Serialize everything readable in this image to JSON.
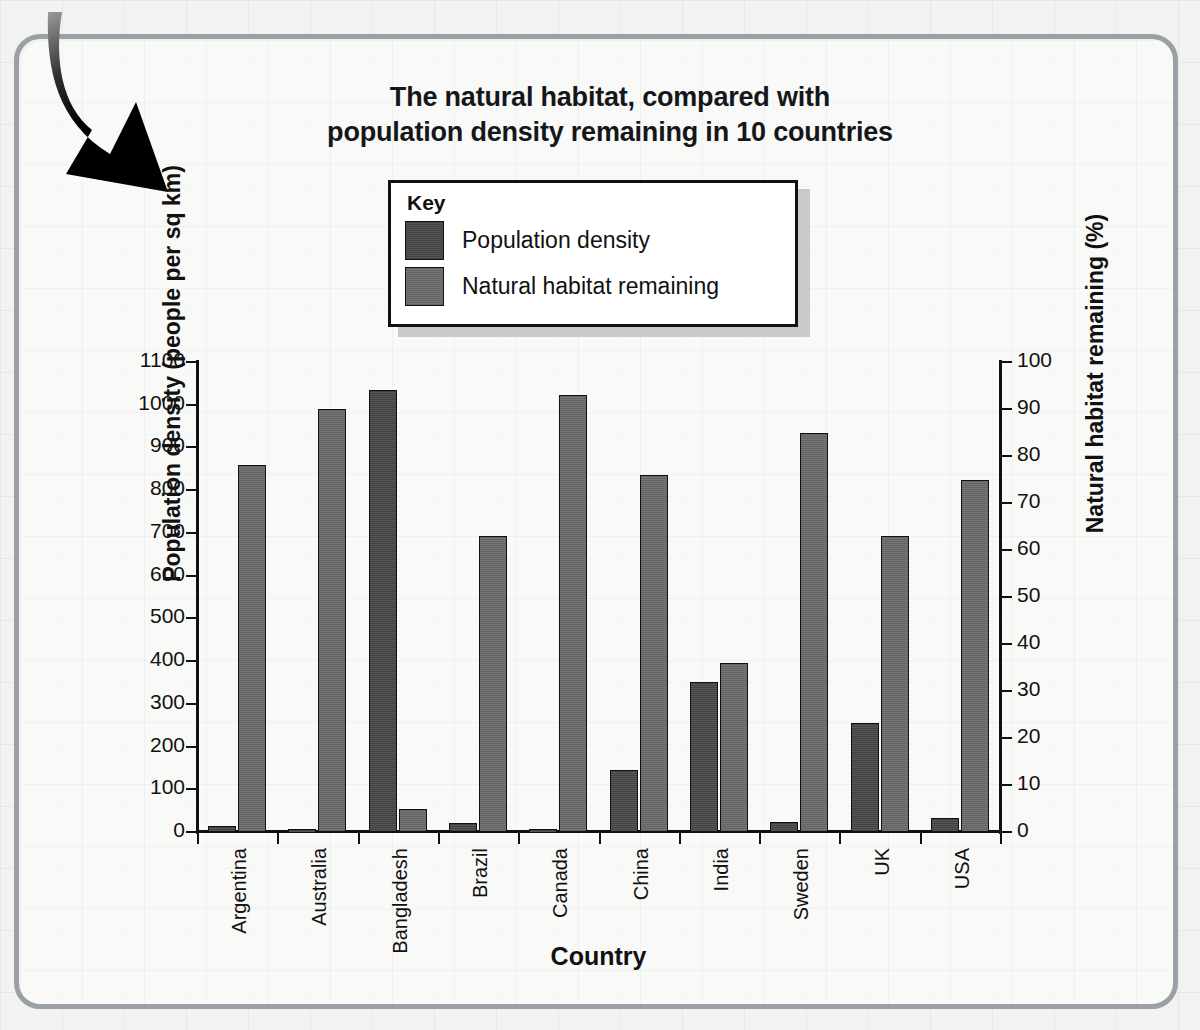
{
  "chart_data": {
    "type": "bar",
    "title": "The natural habitat, compared with population density remaining in 10 countries",
    "title_line1": "The natural habitat, compared with",
    "title_line2": "population density remaining in 10 countries",
    "xlabel": "Country",
    "ylabel": "Population density (people per sq km)",
    "ylabel_right": "Natural habitat remaining (%)",
    "grid": false,
    "legend_position": "top-center",
    "legend_title": "Key",
    "categories": [
      "Argentina",
      "Australia",
      "Bangladesh",
      "Brazil",
      "Canada",
      "China",
      "India",
      "Sweden",
      "UK",
      "USA"
    ],
    "series": [
      {
        "name": "Population density",
        "axis": "left",
        "units": "people per sq km",
        "color": "#4d4d4d",
        "values": [
          13,
          7,
          1035,
          20,
          8,
          145,
          350,
          23,
          255,
          33
        ]
      },
      {
        "name": "Natural habitat remaining",
        "axis": "right",
        "units": "%",
        "color": "#6e6e6e",
        "values": [
          78,
          90,
          5,
          63,
          93,
          76,
          36,
          85,
          63,
          75
        ]
      }
    ],
    "ylim": [
      0,
      1100
    ],
    "ylim_right": [
      0,
      100
    ],
    "yticks": [
      0,
      100,
      200,
      300,
      400,
      500,
      600,
      700,
      800,
      900,
      1000,
      1100
    ],
    "yticks_right": [
      0,
      10,
      20,
      30,
      40,
      50,
      60,
      70,
      80,
      90,
      100
    ],
    "ytick_labels": [
      "0",
      "100",
      "200",
      "300",
      "400",
      "500",
      "600",
      "700",
      "800",
      "900",
      "1000",
      "1100"
    ],
    "ytick_labels_right": [
      "0",
      "10",
      "20",
      "30",
      "40",
      "50",
      "60",
      "70",
      "80",
      "90",
      "100"
    ]
  },
  "decoration": {
    "arrow_name": "curved-down-arrow"
  }
}
